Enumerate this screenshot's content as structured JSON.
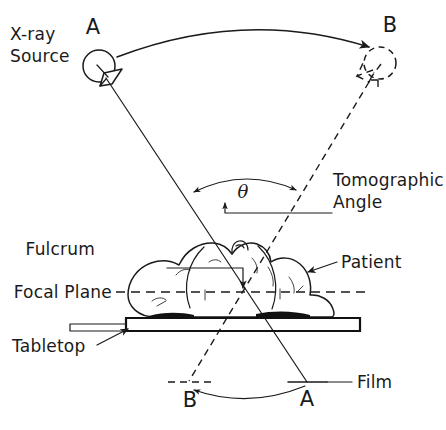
{
  "figure": {
    "background_color": "#ffffff",
    "ink_color": "#1a1a1a",
    "width": 446,
    "height": 430
  },
  "labels": {
    "xray_source_line1": "X-ray",
    "xray_source_line2": "Source",
    "tomographic_angle_line1": "Tomographic",
    "tomographic_angle_line2": "Angle",
    "fulcrum": "Fulcrum",
    "focal_plane": "Focal Plane",
    "tabletop": "Tabletop",
    "patient": "Patient",
    "film": "Film",
    "theta_symbol": "θ"
  },
  "positions": {
    "source_a": "A",
    "source_b": "B",
    "film_a": "A",
    "film_b": "B"
  },
  "annotations": {
    "tube_travel_direction": "A to B",
    "film_travel_direction": "A to B",
    "source_a_state": "solid",
    "source_b_state": "dashed",
    "film_a_state": "solid",
    "film_b_state": "dashed"
  }
}
